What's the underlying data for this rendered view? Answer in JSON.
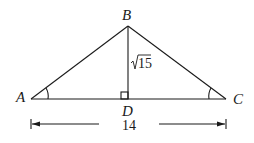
{
  "diagram": {
    "type": "isosceles-triangle-with-altitude",
    "vertices": {
      "A": {
        "label": "A"
      },
      "B": {
        "label": "B"
      },
      "C": {
        "label": "C"
      },
      "D": {
        "label": "D"
      }
    },
    "altitude_label": "15",
    "altitude_label_prefix": "√",
    "base_length_label": "14",
    "right_angle_at": "D",
    "equal_angle_marks": [
      "A",
      "C"
    ]
  }
}
